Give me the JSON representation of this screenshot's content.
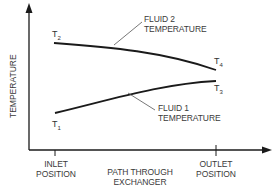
{
  "diagram": {
    "title": "",
    "y_axis_label": "TEMPERATURE",
    "x_axis_label": [
      "PATH THROUGH",
      "EXCHANGER"
    ],
    "inlet_label": [
      "INLET",
      "POSITION"
    ],
    "outlet_label": [
      "OUTLET",
      "POSITION"
    ],
    "curves": [
      {
        "name": "Fluid 2",
        "label": [
          "FLUID 2",
          "TEMPERATURE"
        ],
        "start_point": "T2",
        "end_point": "T4",
        "trend": "decreasing"
      },
      {
        "name": "Fluid 1",
        "label": [
          "FLUID 1",
          "TEMPERATURE"
        ],
        "start_point": "T1",
        "end_point": "T3",
        "trend": "increasing"
      }
    ],
    "points": {
      "T1": {
        "letter": "T",
        "sub": "1"
      },
      "T2": {
        "letter": "T",
        "sub": "2"
      },
      "T3": {
        "letter": "T",
        "sub": "3"
      },
      "T4": {
        "letter": "T",
        "sub": "4"
      }
    },
    "colors": {
      "line": "#1a1a1a",
      "leader": "#555555",
      "background": "#ffffff"
    }
  }
}
